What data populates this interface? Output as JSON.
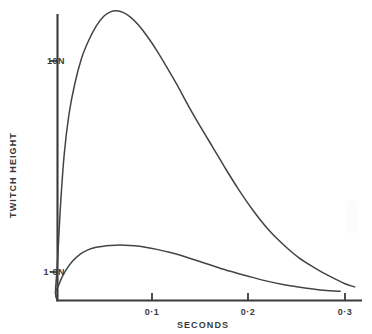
{
  "chart_data": {
    "type": "line",
    "title": "",
    "xlabel": "SECONDS",
    "ylabel": "TWITCH HEIGHT",
    "y_scale": "log",
    "x_scale": "linear",
    "xlim": [
      0,
      0.315
    ],
    "ylim": [
      0.78,
      22
    ],
    "grid": false,
    "legend": null,
    "x_tick_labels": [
      "0·1",
      "0·2",
      "0·3"
    ],
    "x_tick_values": [
      0.1,
      0.2,
      0.3
    ],
    "y_tick_labels": [
      "10N",
      "1·0N"
    ],
    "y_tick_values": [
      10,
      1.0
    ],
    "series": [
      {
        "name": "upper-twitch-curve",
        "x": [
          0.0,
          0.002,
          0.005,
          0.009,
          0.014,
          0.02,
          0.027,
          0.034,
          0.042,
          0.05,
          0.057,
          0.063,
          0.07,
          0.078,
          0.086,
          0.095,
          0.105,
          0.115,
          0.126,
          0.138,
          0.15,
          0.163,
          0.176,
          0.19,
          0.205,
          0.22,
          0.236,
          0.252,
          0.268,
          0.285,
          0.3,
          0.31
        ],
        "y": [
          0.8,
          1.1,
          2.0,
          3.6,
          5.6,
          7.8,
          10.3,
          12.4,
          14.6,
          16.3,
          17.1,
          17.3,
          17.0,
          16.1,
          14.8,
          13.1,
          11.2,
          9.4,
          7.7,
          6.1,
          4.9,
          3.9,
          3.1,
          2.45,
          1.95,
          1.6,
          1.35,
          1.17,
          1.05,
          0.95,
          0.88,
          0.85
        ]
      },
      {
        "name": "lower-twitch-curve",
        "x": [
          0.0,
          0.003,
          0.007,
          0.012,
          0.018,
          0.025,
          0.033,
          0.042,
          0.052,
          0.062,
          0.072,
          0.082,
          0.093,
          0.105,
          0.118,
          0.132,
          0.147,
          0.163,
          0.18,
          0.198,
          0.217,
          0.237,
          0.255,
          0.272,
          0.285,
          0.295
        ],
        "y": [
          0.8,
          0.86,
          0.95,
          1.04,
          1.13,
          1.21,
          1.27,
          1.31,
          1.33,
          1.34,
          1.34,
          1.33,
          1.31,
          1.28,
          1.24,
          1.19,
          1.13,
          1.07,
          1.01,
          0.96,
          0.91,
          0.87,
          0.845,
          0.825,
          0.815,
          0.81
        ]
      }
    ],
    "annotations": []
  },
  "axes": {
    "y_ticks": [
      {
        "label": "10N"
      },
      {
        "label": "1·0N"
      }
    ],
    "x_ticks": [
      {
        "label": "0·1"
      },
      {
        "label": "0·2"
      },
      {
        "label": "0·3"
      }
    ],
    "y_title": "TWITCH HEIGHT",
    "x_title": "SECONDS"
  },
  "style": {
    "ink_color": "#3a3a3a",
    "curve_color": "#444444",
    "background": "#ffffff"
  }
}
